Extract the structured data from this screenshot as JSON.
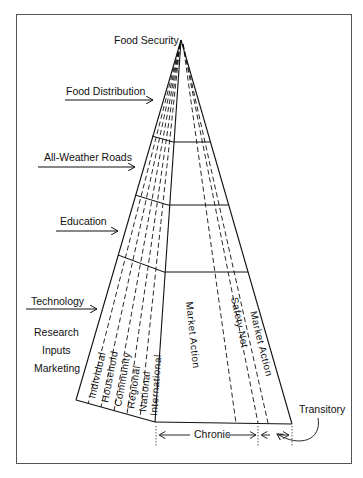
{
  "diagram": {
    "apex_label": "Food Security",
    "inputs": [
      {
        "label": "Food Distribution"
      },
      {
        "label": "All-Weather Roads"
      },
      {
        "label": "Education"
      },
      {
        "label": "Technology"
      }
    ],
    "technology_subitems": [
      "Research",
      "Inputs",
      "Marketing"
    ],
    "levels": [
      "Individual",
      "Household",
      "Community",
      "Regional",
      "National",
      "International"
    ],
    "right_sections": {
      "market_action_center": "Market Action",
      "safety_net": "Safety Net",
      "market_action_right": "Market Action"
    },
    "bottom": {
      "chronic": "Chronic",
      "transitory": "Transitory"
    }
  }
}
